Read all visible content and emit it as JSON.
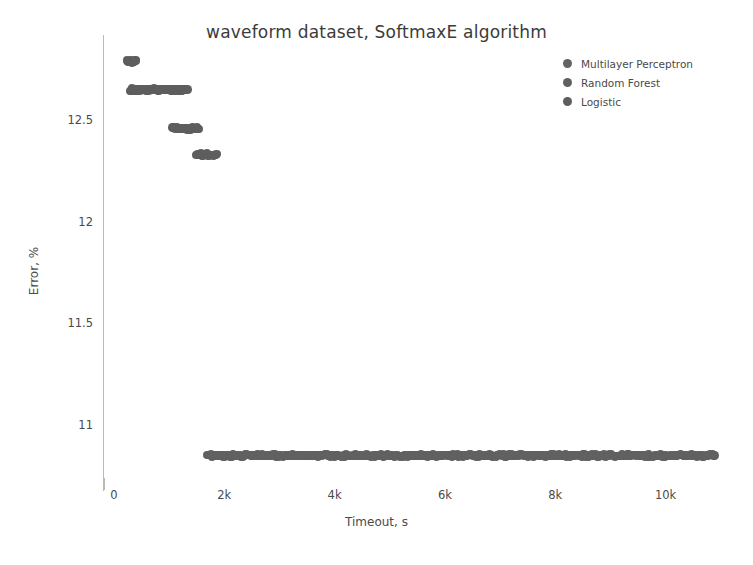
{
  "chart_data": {
    "type": "scatter",
    "title": "waveform dataset, SoftmaxE algorithm",
    "xlabel": "Timeout, s",
    "ylabel": "Error, %",
    "xlim": [
      -180,
      11350
    ],
    "ylim": [
      10.68,
      12.92
    ],
    "xticks": [
      0,
      2000,
      4000,
      6000,
      8000,
      10000
    ],
    "xticklabels": [
      "0",
      "2k",
      "4k",
      "6k",
      "8k",
      "10k"
    ],
    "yticks": [
      11,
      11.5,
      12,
      12.5
    ],
    "yticklabels": [
      "11",
      "11.5",
      "12",
      "12.5"
    ],
    "grid": false,
    "legend_position": "upper right",
    "marker_color": "#616161",
    "series": [
      {
        "name": "Multilayer Perceptron",
        "color": "#616161",
        "marker": "circle",
        "comment": "dense low-error band spanning long timeouts",
        "x_range": [
          1700,
          10890
        ],
        "y_value": 10.85,
        "n_points": 460
      },
      {
        "name": "Random Forest",
        "color": "#5e5e5e",
        "marker": "circle",
        "comment": "short clusters at higher error, descending with timeout",
        "clusters": [
          {
            "x_range": [
              240,
              400
            ],
            "y_value": 12.79,
            "n_points": 14
          },
          {
            "x_range": [
              290,
              1330
            ],
            "y_value": 12.65,
            "n_points": 60
          },
          {
            "x_range": [
              1060,
              1540
            ],
            "y_value": 12.46,
            "n_points": 30
          },
          {
            "x_range": [
              1500,
              1860
            ],
            "y_value": 12.33,
            "n_points": 20
          }
        ]
      },
      {
        "name": "Logistic",
        "color": "#5b5b5b",
        "marker": "circle"
      }
    ]
  },
  "legend": {
    "items": [
      {
        "label": "Multilayer Perceptron",
        "color": "#636363"
      },
      {
        "label": "Random Forest",
        "color": "#606060"
      },
      {
        "label": "Logistic",
        "color": "#5d5d5d"
      }
    ]
  }
}
